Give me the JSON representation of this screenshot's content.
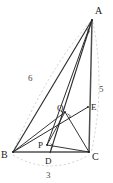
{
  "figure": {
    "type": "geometry-diagram",
    "colors": {
      "solid_stroke": "#2b2b2b",
      "thick_stroke": "#555555",
      "dashed_stroke": "#bdbdbd",
      "label_text": "#1a1a1a",
      "measure_text": "#4a4a4a",
      "background": "#ffffff"
    },
    "points": [
      {
        "id": "A",
        "label": "A",
        "x": 92,
        "y": 20,
        "label_x": 95,
        "label_y": 12
      },
      {
        "id": "B",
        "label": "B",
        "x": 13,
        "y": 152,
        "label_x": 2,
        "label_y": 157
      },
      {
        "id": "C",
        "label": "C",
        "x": 89,
        "y": 152,
        "label_x": 93,
        "label_y": 158
      },
      {
        "id": "D",
        "label": "D",
        "x": 50,
        "y": 152,
        "label_x": 46,
        "label_y": 163
      },
      {
        "id": "P",
        "label": "P",
        "x": 47,
        "y": 145,
        "label_x": 39,
        "label_y": 148
      },
      {
        "id": "Q",
        "label": "Q",
        "x": 65,
        "y": 112,
        "label_x": 58,
        "label_y": 110
      },
      {
        "id": "E",
        "label": "E",
        "x": 88,
        "y": 107,
        "label_x": 92,
        "label_y": 109
      }
    ],
    "segments": [
      {
        "id": "AB",
        "from": "A",
        "to": "B"
      },
      {
        "id": "AC",
        "from": "A",
        "to": "C"
      },
      {
        "id": "BC",
        "from": "B",
        "to": "C"
      },
      {
        "id": "AD",
        "from": "A",
        "to": "D"
      },
      {
        "id": "AP",
        "from": "A",
        "to": "P"
      },
      {
        "id": "BE",
        "from": "B",
        "to": "E"
      },
      {
        "id": "BQ",
        "from": "B",
        "to": "Q"
      },
      {
        "id": "PC",
        "from": "P",
        "to": "C"
      },
      {
        "id": "QC",
        "from": "Q",
        "to": "C"
      },
      {
        "id": "PQ",
        "from": "P",
        "to": "Q"
      }
    ],
    "right_angles": [
      {
        "id": "right-angle-P",
        "at": "P"
      },
      {
        "id": "right-angle-Q",
        "at": "Q"
      },
      {
        "id": "right-angle-A",
        "at": "A"
      }
    ],
    "measures": [
      {
        "id": "side-AB",
        "value": "6",
        "side": "AB",
        "x": 31,
        "y": 78
      },
      {
        "id": "side-AC",
        "value": "5",
        "side": "AC",
        "x": 101,
        "y": 89
      },
      {
        "id": "side-BC",
        "value": "3",
        "side": "BC",
        "x": 49,
        "y": 176
      }
    ],
    "arcs": [
      {
        "id": "arc-AB",
        "label": "6"
      },
      {
        "id": "arc-AC",
        "label": "5"
      },
      {
        "id": "arc-BC",
        "label": "3"
      }
    ]
  }
}
